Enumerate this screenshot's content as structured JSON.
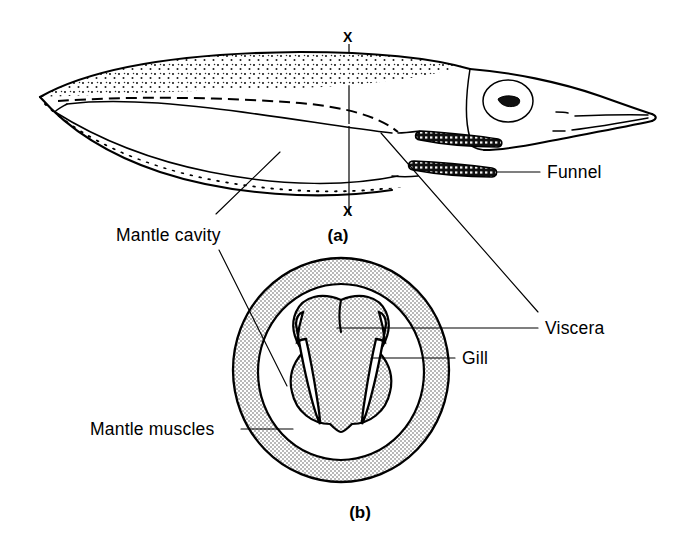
{
  "figure": {
    "background_color": "#ffffff",
    "ink_color": "#000000",
    "stipple_color": "#d8d8d8"
  },
  "panels": [
    {
      "id": "a",
      "caption": "(a)",
      "description": "Lateral external view of squid"
    },
    {
      "id": "b",
      "caption": "(b)",
      "description": "Transverse section through plane X-X"
    }
  ],
  "section_plane": {
    "top_mark": "X",
    "bottom_mark": "X"
  },
  "labels": [
    {
      "id": "funnel",
      "text": "Funnel"
    },
    {
      "id": "mantle-cavity",
      "text": "Mantle cavity"
    },
    {
      "id": "viscera",
      "text": "Viscera"
    },
    {
      "id": "gill",
      "text": "Gill"
    },
    {
      "id": "mantle-muscles",
      "text": "Mantle muscles"
    }
  ],
  "icons": {
    "eye": "eye-icon",
    "funnel_bar": "funnel-icon",
    "gill_left": "gill-icon",
    "gill_right": "gill-icon"
  }
}
